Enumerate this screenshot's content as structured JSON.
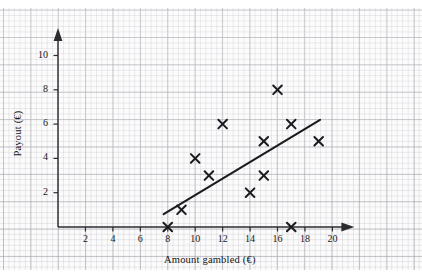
{
  "chart_data": {
    "type": "scatter",
    "title": "",
    "xlabel": "Amount gambled (€)",
    "ylabel": "Payout (€)",
    "xlim": [
      0,
      21.6
    ],
    "ylim": [
      0,
      11.6
    ],
    "xticks": [
      2,
      4,
      6,
      8,
      10,
      12,
      14,
      16,
      18,
      20
    ],
    "yticks": [
      2,
      4,
      6,
      8,
      10
    ],
    "xtick_labels": [
      "2",
      "4",
      "6",
      "8",
      "10",
      "12",
      "14",
      "16",
      "18",
      "20"
    ],
    "ytick_labels": [
      "2",
      "4",
      "6",
      "8",
      "10"
    ],
    "grid": true,
    "legend": null,
    "points": [
      {
        "x": 8,
        "y": 0
      },
      {
        "x": 9,
        "y": 1
      },
      {
        "x": 10,
        "y": 4
      },
      {
        "x": 11,
        "y": 3
      },
      {
        "x": 12,
        "y": 6
      },
      {
        "x": 14,
        "y": 2
      },
      {
        "x": 15,
        "y": 3
      },
      {
        "x": 15,
        "y": 5
      },
      {
        "x": 16,
        "y": 8
      },
      {
        "x": 17,
        "y": 0
      },
      {
        "x": 17,
        "y": 6
      },
      {
        "x": 19,
        "y": 5
      }
    ],
    "marker": "x",
    "marker_color": "#1b1b1f",
    "trend_line": {
      "label": "line of best fit",
      "x_start": 7.7,
      "y_start": 0.75,
      "x_end": 19.1,
      "y_end": 6.25,
      "color": "#1b1b1f"
    },
    "axis_color": "#2b2b30",
    "grid_color": "#9aa0a8",
    "background": "#fbfbfb"
  }
}
